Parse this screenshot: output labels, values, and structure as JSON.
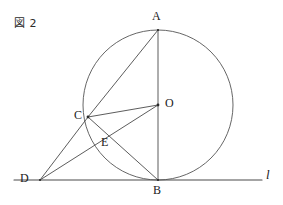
{
  "figure": {
    "caption": "図 2",
    "width": 283,
    "height": 205,
    "background_color": "#ffffff",
    "stroke_color": "#4a4a4a",
    "circle_stroke_color": "#555555",
    "label_color": "#1a1a1a",
    "stroke_width": 0.9
  },
  "chart_data": {
    "type": "diagram",
    "title": "図 2",
    "circle": {
      "center_label": "O",
      "cx": 158,
      "cy": 105,
      "r": 75
    },
    "points": [
      {
        "label": "A",
        "x": 158,
        "y": 30,
        "label_x": 154,
        "label_y": 12
      },
      {
        "label": "O",
        "x": 158,
        "y": 105,
        "label_x": 164,
        "label_y": 98
      },
      {
        "label": "C",
        "x": 88,
        "y": 117,
        "label_x": 74,
        "label_y": 110
      },
      {
        "label": "B",
        "x": 158,
        "y": 180,
        "label_x": 154,
        "label_y": 184
      },
      {
        "label": "D",
        "x": 40,
        "y": 180,
        "label_x": 22,
        "label_y": 173
      },
      {
        "label": "E",
        "x": 104,
        "y": 134,
        "label_x": 104,
        "label_y": 136
      }
    ],
    "segments": [
      {
        "name": "AB",
        "from": "A",
        "to": "B"
      },
      {
        "name": "AC",
        "from": "A",
        "to": "C"
      },
      {
        "name": "CO",
        "from": "C",
        "to": "O"
      },
      {
        "name": "CB",
        "from": "C",
        "to": "B"
      },
      {
        "name": "CD",
        "from": "C",
        "to": "D"
      },
      {
        "name": "DO",
        "from": "D",
        "to": "O"
      }
    ],
    "tangent_line": {
      "label": "l",
      "y": 180,
      "x_start": 14,
      "x_end": 262,
      "label_x": 266,
      "label_y": 168
    }
  }
}
